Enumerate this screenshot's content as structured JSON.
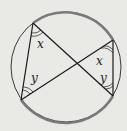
{
  "diagram": {
    "type": "circle-geometry",
    "colors": {
      "background": "#e9e9e6",
      "lines": "#1a1a1a",
      "circle": "#3a3a3a",
      "highlight_arc": "#7a7a7a"
    },
    "circle": {
      "cx": 66,
      "cy": 67,
      "r": 55
    },
    "points": {
      "A": [
        33,
        23
      ],
      "B": [
        21,
        100
      ],
      "C": [
        113,
        40
      ],
      "D": [
        113,
        96
      ]
    },
    "segments": [
      [
        "A",
        "B"
      ],
      [
        "A",
        "D"
      ],
      [
        "B",
        "C"
      ],
      [
        "C",
        "D"
      ]
    ],
    "angle_labels": [
      {
        "text": "x",
        "x": 37,
        "y": 48
      },
      {
        "text": "y",
        "x": 31,
        "y": 82
      },
      {
        "text": "x",
        "x": 96,
        "y": 64
      },
      {
        "text": "y",
        "x": 100,
        "y": 82
      }
    ]
  }
}
